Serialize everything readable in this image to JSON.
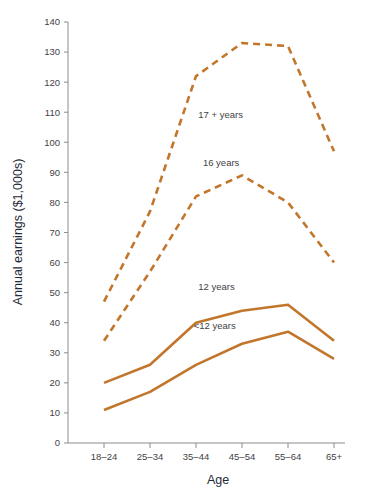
{
  "chart_data": {
    "type": "line",
    "title": "",
    "xlabel": "Age",
    "ylabel": "Annual earnings ($1,000s)",
    "categories": [
      "18–24",
      "25–34",
      "35–44",
      "45–54",
      "55–64",
      "65+"
    ],
    "ylim": [
      0,
      140
    ],
    "yticks": [
      0,
      10,
      20,
      30,
      40,
      50,
      60,
      70,
      80,
      90,
      100,
      110,
      120,
      130,
      140
    ],
    "ytick_labels": [
      "0",
      "10",
      "20",
      "30",
      "40",
      "50",
      "60",
      "70",
      "80",
      "90",
      "100",
      "110",
      "120",
      "130",
      "140"
    ],
    "grid": false,
    "legend": "inline-annotations",
    "line_color": "#c2762b",
    "series": [
      {
        "name": "17 + years",
        "style": "dashed",
        "values": [
          47,
          77,
          122,
          133,
          132,
          97
        ]
      },
      {
        "name": "16 years",
        "style": "dashed",
        "values": [
          34,
          57,
          82,
          89,
          80,
          60
        ]
      },
      {
        "name": "12 years",
        "style": "solid",
        "values": [
          20,
          26,
          40,
          44,
          46,
          34
        ]
      },
      {
        "name": "<12 years",
        "style": "solid",
        "values": [
          11,
          17,
          26,
          33,
          37,
          28
        ]
      }
    ],
    "annotations": [
      {
        "text": "17 + years",
        "x": 2.05,
        "y": 108
      },
      {
        "text": "16 years",
        "x": 2.15,
        "y": 92
      },
      {
        "text": "12 years",
        "x": 2.05,
        "y": 51
      },
      {
        "text": "<12 years",
        "x": 1.95,
        "y": 38
      }
    ]
  }
}
